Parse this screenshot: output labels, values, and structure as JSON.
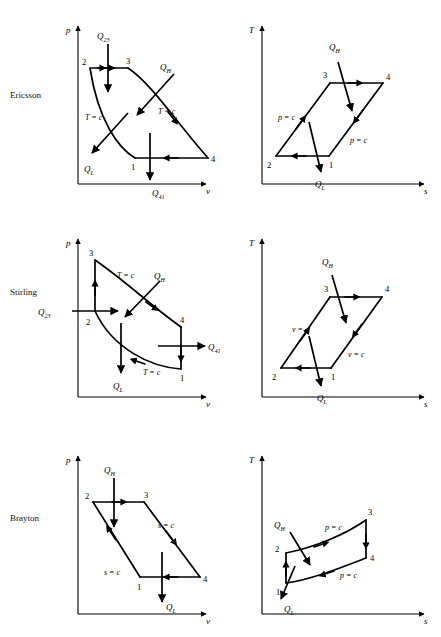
{
  "figure": {
    "kind": "thermodynamic-cycle-diagrams",
    "rows": [
      {
        "name": "Ericsson",
        "pv": {
          "yaxis_label": "p",
          "xaxis_label": "v",
          "points": [
            "2",
            "3",
            "1",
            "4"
          ],
          "process_labels": [
            "T = c",
            "T = c"
          ],
          "heat_labels": [
            "Q",
            "Q",
            "Q",
            "Q"
          ],
          "heat_full": [
            "Q23",
            "QH",
            "QL",
            "Q41"
          ],
          "q_top": "Q",
          "q_top_sub": "23",
          "q_high": "Q",
          "q_high_sub": "H",
          "q_low": "Q",
          "q_low_sub": "L",
          "q_bottom": "Q",
          "q_bottom_sub": "41"
        },
        "ts": {
          "yaxis_label": "T",
          "xaxis_label": "s",
          "points": [
            "2",
            "1",
            "3",
            "4"
          ],
          "process_labels": [
            "p = c",
            "p = c"
          ],
          "q_high": "Q",
          "q_high_sub": "H",
          "q_low": "Q",
          "q_low_sub": "L"
        }
      },
      {
        "name": "Stirling",
        "pv": {
          "yaxis_label": "p",
          "xaxis_label": "v",
          "points": [
            "3",
            "2",
            "4",
            "1"
          ],
          "process_labels": [
            "T = c",
            "T = c"
          ],
          "q_left": "Q",
          "q_left_sub": "23",
          "q_high": "Q",
          "q_high_sub": "H",
          "q_low": "Q",
          "q_low_sub": "L",
          "q_right": "Q",
          "q_right_sub": "41"
        },
        "ts": {
          "yaxis_label": "T",
          "xaxis_label": "s",
          "points": [
            "2",
            "1",
            "3",
            "4"
          ],
          "process_labels": [
            "v = c",
            "v = c"
          ],
          "q_high": "Q",
          "q_high_sub": "H",
          "q_low": "Q",
          "q_low_sub": "L"
        }
      },
      {
        "name": "Brayton",
        "pv": {
          "yaxis_label": "p",
          "xaxis_label": "v",
          "points": [
            "2",
            "3",
            "1",
            "4"
          ],
          "process_labels": [
            "s = c",
            "s = c"
          ],
          "q_high": "Q",
          "q_high_sub": "H",
          "q_low": "Q",
          "q_low_sub": "L"
        },
        "ts": {
          "yaxis_label": "T",
          "xaxis_label": "s",
          "points": [
            "1",
            "2",
            "3",
            "4"
          ],
          "process_labels": [
            "p = c",
            "p = c"
          ],
          "q_high": "Q",
          "q_high_sub": "H",
          "q_low": "Q",
          "q_low_sub": "L"
        }
      }
    ]
  },
  "ericsson": {
    "label": "Ericsson",
    "pv": {
      "p": "p",
      "v": "v",
      "pt2": "2",
      "pt3": "3",
      "pt1": "1",
      "pt4": "4",
      "tc_left": "T = c",
      "tc_right": "T = c",
      "q23": "Q",
      "q23s": "23",
      "qh": "Q",
      "qhs": "H",
      "ql": "Q",
      "qls": "L",
      "q41": "Q",
      "q41s": "41"
    },
    "ts": {
      "T": "T",
      "s": "s",
      "pt2": "2",
      "pt1": "1",
      "pt3": "3",
      "pt4": "4",
      "pc_left": "p = c",
      "pc_right": "p = c",
      "qh": "Q",
      "qhs": "H",
      "ql": "Q",
      "qls": "L"
    }
  },
  "stirling": {
    "label": "Stirling",
    "pv": {
      "p": "p",
      "v": "v",
      "pt3": "3",
      "pt2": "2",
      "pt4": "4",
      "pt1": "1",
      "tc_top": "T = c",
      "tc_bottom": "T = c",
      "q23": "Q",
      "q23s": "23",
      "qh": "Q",
      "qhs": "H",
      "ql": "Q",
      "qls": "L",
      "q41": "Q",
      "q41s": "41"
    },
    "ts": {
      "T": "T",
      "s": "s",
      "pt2": "2",
      "pt1": "1",
      "pt3": "3",
      "pt4": "4",
      "vc_left": "v = c",
      "vc_right": "v = c",
      "qh": "Q",
      "qhs": "H",
      "ql": "Q",
      "qls": "L"
    }
  },
  "brayton": {
    "label": "Brayton",
    "pv": {
      "p": "p",
      "v": "v",
      "pt2": "2",
      "pt3": "3",
      "pt1": "1",
      "pt4": "4",
      "sc_left": "s = c",
      "sc_right": "s = c",
      "qh": "Q",
      "qhs": "H",
      "ql": "Q",
      "qls": "L"
    },
    "ts": {
      "T": "T",
      "s": "s",
      "pt1": "1",
      "pt2": "2",
      "pt3": "3",
      "pt4": "4",
      "pc_top": "p = c",
      "pc_bottom": "p = c",
      "qh": "Q",
      "qhs": "H",
      "ql": "Q",
      "qls": "L"
    }
  },
  "colors": {
    "ink": "#000000",
    "background": "#ffffff"
  }
}
